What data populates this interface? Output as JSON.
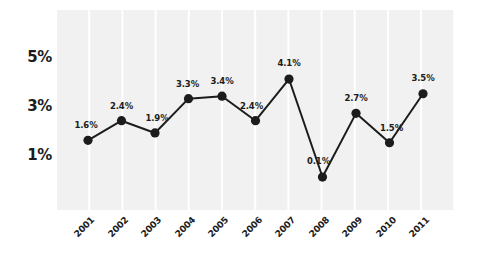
{
  "chart_data": {
    "type": "line",
    "title": "",
    "subtitle": "",
    "xlabel": "",
    "ylabel": "",
    "categories": [
      "2001",
      "2002",
      "2003",
      "2004",
      "2005",
      "2006",
      "2007",
      "2008",
      "2009",
      "2010",
      "2011"
    ],
    "values": [
      1.6,
      2.4,
      1.9,
      3.3,
      3.4,
      2.4,
      4.1,
      0.1,
      2.7,
      1.5,
      3.5
    ],
    "point_labels": [
      "1.6%",
      "2.4%",
      "1.9%",
      "3.3%",
      "3.4%",
      "2.4%",
      "4.1%",
      "0.1%",
      "2.7%",
      "1.5%",
      "3.5%"
    ],
    "ylim": [
      0.0,
      5.8
    ],
    "ytick_values": [
      5,
      3,
      1
    ],
    "ytick_labels": [
      "5%",
      "3%",
      "1%"
    ],
    "grid": true,
    "legend": null,
    "series": [
      {
        "name": "",
        "values": [
          1.6,
          2.4,
          1.9,
          3.3,
          3.4,
          2.4,
          4.1,
          0.1,
          2.7,
          1.5,
          3.5
        ],
        "color": "#1c1c1c",
        "marker": "circle",
        "marker_color": "#1c1c1c"
      }
    ]
  },
  "style": {
    "line_color": "#1c1c1c",
    "marker_color": "#1c1c1c",
    "text_color": "#1c1c1c",
    "grid_cell_color": "#f1f1f1",
    "background_color": "#ffffff"
  }
}
